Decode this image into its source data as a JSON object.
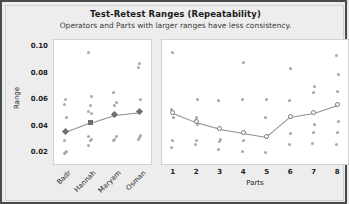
{
  "chart": {
    "title": "Test-Retest Ranges (Repeatability)",
    "subtitle": "Operators and Parts with larger ranges have less consistency.",
    "ylabel": "Range",
    "parts_axis_label": "Parts",
    "yticks": [
      "0.10",
      "0.08",
      "0.06",
      "0.04",
      "0.02"
    ]
  },
  "colors": {
    "frame_border": "#4a4a4a",
    "background": "#ededee",
    "panel_background": "#ffffff",
    "point": "#a9a9ad",
    "mean_marker": "#6d6d72",
    "line": "#8e8e93"
  },
  "chart_data": {
    "type": "scatter",
    "title": "Test-Retest Ranges (Repeatability)",
    "subtitle": "Operators and Parts with larger ranges have less consistency.",
    "ylabel": "Range",
    "ylim": [
      0.01,
      0.105
    ],
    "yticks": [
      0.02,
      0.04,
      0.06,
      0.08,
      0.1
    ],
    "grid": false,
    "legend": "none",
    "panels": [
      {
        "name": "operators",
        "xlabel": "",
        "categories": [
          "Badr",
          "Hannah",
          "Maryam",
          "Osman"
        ],
        "mean_marker": "filled",
        "means": [
          0.0355,
          0.0425,
          0.0485,
          0.0505
        ],
        "points": [
          [
            0.019,
            0.02,
            0.021,
            0.029,
            0.036,
            0.046,
            0.056,
            0.06
          ],
          [
            0.025,
            0.029,
            0.03,
            0.032,
            0.042,
            0.049,
            0.051,
            0.055,
            0.062,
            0.095
          ],
          [
            0.029,
            0.03,
            0.032,
            0.049,
            0.055,
            0.058,
            0.065
          ],
          [
            0.03,
            0.031,
            0.033,
            0.05,
            0.051,
            0.06,
            0.084,
            0.087
          ]
        ]
      },
      {
        "name": "parts",
        "xlabel": "Parts",
        "categories": [
          "1",
          "2",
          "3",
          "4",
          "5",
          "6",
          "7",
          "8"
        ],
        "mean_marker": "open",
        "means": [
          0.05,
          0.043,
          0.038,
          0.035,
          0.032,
          0.047,
          0.05,
          0.056
        ],
        "points": [
          [
            0.024,
            0.029,
            0.046,
            0.052,
            0.095
          ],
          [
            0.026,
            0.029,
            0.041,
            0.044,
            0.046,
            0.06
          ],
          [
            0.022,
            0.028,
            0.03,
            0.059
          ],
          [
            0.021,
            0.029,
            0.035,
            0.06,
            0.088
          ],
          [
            0.02,
            0.031,
            0.033,
            0.046,
            0.06
          ],
          [
            0.026,
            0.034,
            0.047,
            0.059,
            0.083
          ],
          [
            0.027,
            0.035,
            0.041,
            0.05,
            0.065,
            0.07
          ],
          [
            0.026,
            0.035,
            0.043,
            0.056,
            0.066,
            0.079,
            0.093
          ]
        ]
      }
    ]
  }
}
